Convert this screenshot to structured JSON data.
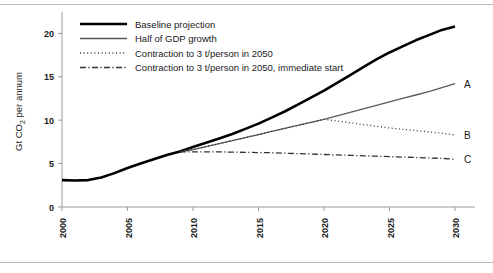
{
  "figure": {
    "title": "",
    "y_axis_title": "Gt CO",
    "y_axis_title_sub": "2",
    "y_axis_title_tail": " per annum"
  },
  "legend": {
    "items": [
      {
        "label": "Baseline projection",
        "style": "solid-thick",
        "color": "#000000"
      },
      {
        "label": "Half of GDP growth",
        "style": "solid-thin",
        "color": "#555555"
      },
      {
        "label": "Contraction to 3 t/person in 2050",
        "style": "dotted",
        "color": "#333333"
      },
      {
        "label": "Contraction to 3 t/person in 2050, immediate start",
        "style": "dashdot",
        "color": "#333333"
      }
    ]
  },
  "end_labels": [
    {
      "text": "A",
      "value": 14.2,
      "x": 2030
    },
    {
      "text": "B",
      "value": 8.3,
      "x": 2030
    },
    {
      "text": "C",
      "value": 5.5,
      "x": 2030
    }
  ],
  "chart_data": {
    "type": "line",
    "title": "",
    "xlabel": "",
    "ylabel": "Gt CO2 per annum",
    "xlim": [
      2000,
      2030
    ],
    "ylim": [
      0,
      22
    ],
    "yticks": [
      0,
      5,
      10,
      15,
      20
    ],
    "ytick_labels": [
      "0",
      "5",
      "10",
      "15",
      "20"
    ],
    "xticks": [
      2000,
      2005,
      2010,
      2015,
      2020,
      2025,
      2030
    ],
    "xtick_labels": [
      "2000",
      "2005",
      "2010",
      "2015",
      "2020",
      "2025",
      "2030"
    ],
    "grid": false,
    "legend_position": "top-left",
    "series": [
      {
        "name": "Baseline projection",
        "end_label": "",
        "style": "solid-thick",
        "color": "#000000",
        "width": 2.6,
        "x": [
          2000,
          2001,
          2002,
          2003,
          2004,
          2005,
          2006,
          2007,
          2008,
          2009,
          2010,
          2011,
          2012,
          2013,
          2014,
          2015,
          2016,
          2017,
          2018,
          2019,
          2020,
          2021,
          2022,
          2023,
          2024,
          2025,
          2026,
          2027,
          2028,
          2029,
          2030
        ],
        "values": [
          3.1,
          3.05,
          3.1,
          3.4,
          3.9,
          4.5,
          5.0,
          5.5,
          6.0,
          6.4,
          6.9,
          7.4,
          7.9,
          8.4,
          9.0,
          9.6,
          10.3,
          11.0,
          11.8,
          12.6,
          13.4,
          14.3,
          15.2,
          16.1,
          17.0,
          17.8,
          18.5,
          19.2,
          19.8,
          20.4,
          20.8
        ]
      },
      {
        "name": "Half of GDP growth",
        "end_label": "A",
        "style": "solid-thin",
        "color": "#5a5a5a",
        "width": 1.3,
        "x": [
          2009,
          2010,
          2011,
          2012,
          2013,
          2014,
          2015,
          2016,
          2017,
          2018,
          2019,
          2020,
          2021,
          2022,
          2023,
          2024,
          2025,
          2026,
          2027,
          2028,
          2029,
          2030
        ],
        "values": [
          6.35,
          6.6,
          6.95,
          7.3,
          7.65,
          8.0,
          8.35,
          8.7,
          9.05,
          9.4,
          9.75,
          10.1,
          10.5,
          10.9,
          11.3,
          11.7,
          12.1,
          12.5,
          12.9,
          13.3,
          13.75,
          14.2
        ]
      },
      {
        "name": "Contraction to 3 t/person in 2050",
        "end_label": "B",
        "style": "dotted",
        "color": "#333333",
        "width": 1.3,
        "x": [
          2009,
          2010,
          2011,
          2012,
          2013,
          2014,
          2015,
          2016,
          2017,
          2018,
          2019,
          2020,
          2021,
          2022,
          2023,
          2024,
          2025,
          2026,
          2027,
          2028,
          2029,
          2030
        ],
        "values": [
          6.35,
          6.6,
          6.95,
          7.3,
          7.65,
          8.0,
          8.35,
          8.7,
          9.05,
          9.4,
          9.75,
          10.1,
          9.9,
          9.7,
          9.5,
          9.3,
          9.1,
          8.95,
          8.8,
          8.65,
          8.5,
          8.3
        ]
      },
      {
        "name": "Contraction to 3 t/person in 2050, immediate start",
        "end_label": "C",
        "style": "dashdot",
        "color": "#333333",
        "width": 1.3,
        "x": [
          2009,
          2010,
          2011,
          2012,
          2013,
          2014,
          2015,
          2016,
          2017,
          2018,
          2019,
          2020,
          2021,
          2022,
          2023,
          2024,
          2025,
          2026,
          2027,
          2028,
          2029,
          2030
        ],
        "values": [
          6.35,
          6.35,
          6.35,
          6.35,
          6.32,
          6.3,
          6.27,
          6.25,
          6.2,
          6.15,
          6.1,
          6.05,
          6.0,
          5.95,
          5.9,
          5.85,
          5.8,
          5.75,
          5.7,
          5.65,
          5.6,
          5.5
        ]
      }
    ]
  }
}
